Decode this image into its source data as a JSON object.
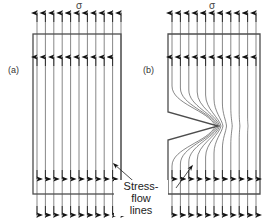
{
  "figure": {
    "title_stress_symbol": "σ",
    "panels": [
      {
        "id": "a",
        "label": "(a)",
        "stress_label": "σ",
        "description": "unnotched bar, uniform parallel stress-flow lines"
      },
      {
        "id": "b",
        "label": "(b)",
        "stress_label": "σ",
        "description": "notched bar, stress-flow lines crowd around the V-notch tip"
      }
    ],
    "annotation": {
      "line1": "Stress-flow",
      "line2": "lines"
    },
    "colors": {
      "outline": "#4d4d4d",
      "flow_line": "#555555",
      "arrow": "#111111",
      "text": "#222222",
      "background": "#ffffff"
    },
    "geometry": {
      "panel_a": {
        "x": 33,
        "y": 34,
        "w": 88,
        "h": 160,
        "n_lines": 11
      },
      "panel_b": {
        "x": 168,
        "y": 34,
        "w": 92,
        "h": 160,
        "n_lines": 11,
        "notch": {
          "mouth_y_top": 112,
          "mouth_y_bottom": 140,
          "tip_x": 218,
          "tip_y": 126
        }
      },
      "arrow_rows": {
        "outer_top_y": 14,
        "inner_top_y": 58,
        "inner_bottom_y": 178,
        "outer_bottom_y": 214
      }
    }
  }
}
